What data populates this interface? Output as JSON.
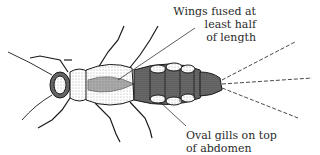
{
  "figure": {
    "stroke_color": "#1a1a1a",
    "background": "#ffffff"
  },
  "callouts": [
    {
      "id": "wings",
      "line1": "Wings fused at least half",
      "line2": "of length"
    },
    {
      "id": "gills",
      "line1": "Oval gills on top",
      "line2": "of abdomen"
    }
  ]
}
